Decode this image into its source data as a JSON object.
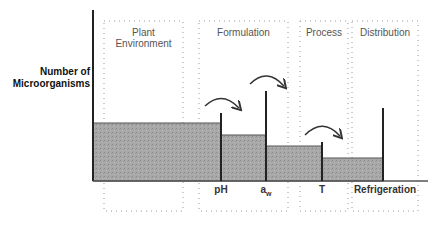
{
  "diagram": {
    "y_axis_label_line1": "Number of",
    "y_axis_label_line2": "Microorganisms",
    "stages": [
      {
        "title_line1": "Plant",
        "title_line2": "Environment",
        "box": {
          "x": 104,
          "y": 21,
          "w": 79,
          "h": 190
        }
      },
      {
        "title_line1": "Formulation",
        "title_line2": "",
        "box": {
          "x": 199,
          "y": 21,
          "w": 89,
          "h": 190
        }
      },
      {
        "title_line1": "Process",
        "title_line2": "",
        "box": {
          "x": 300,
          "y": 21,
          "w": 48,
          "h": 190
        }
      },
      {
        "title_line1": "Distribution",
        "title_line2": "",
        "box": {
          "x": 352,
          "y": 21,
          "w": 66,
          "h": 190
        }
      }
    ],
    "hurdles": [
      {
        "label": "pH",
        "x": 221,
        "top": 113
      },
      {
        "label": "aw",
        "label_main": "a",
        "label_sub": "w",
        "x": 266,
        "top": 91
      },
      {
        "label": "T",
        "x": 322,
        "top": 142
      },
      {
        "label": "Refrigeration",
        "x": 383,
        "top": 108
      }
    ],
    "bars": [
      {
        "x0": 93,
        "x1": 221,
        "top": 123
      },
      {
        "x0": 221,
        "x1": 266,
        "top": 135
      },
      {
        "x0": 266,
        "x1": 322,
        "top": 146
      },
      {
        "x0": 322,
        "x1": 383,
        "top": 158
      }
    ],
    "colors": {
      "bar_fill": "#a9a9a9",
      "bar_stroke": "#555555",
      "axis": "#222222",
      "dotted_box": "#9a9a9a",
      "arrow": "#333333"
    }
  }
}
